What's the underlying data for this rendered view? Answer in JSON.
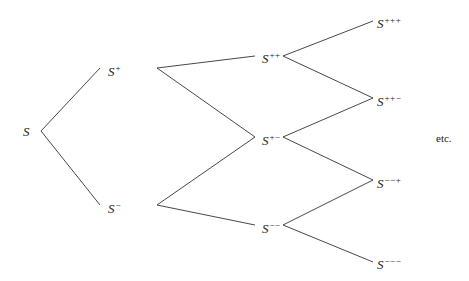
{
  "diagram": {
    "type": "binomial-tree",
    "line_color": "#333333",
    "nodes": [
      {
        "id": "S",
        "base": "S",
        "sup": "",
        "x": 23,
        "y": 125
      },
      {
        "id": "Sp",
        "base": "S",
        "sup": "+",
        "x": 108,
        "y": 62
      },
      {
        "id": "Sm",
        "base": "S",
        "sup": "−",
        "x": 108,
        "y": 199
      },
      {
        "id": "Spp",
        "base": "S",
        "sup": "++",
        "x": 262,
        "y": 49
      },
      {
        "id": "Spm",
        "base": "S",
        "sup": "+−",
        "x": 262,
        "y": 131
      },
      {
        "id": "Smm",
        "base": "S",
        "sup": "−−",
        "x": 262,
        "y": 219
      },
      {
        "id": "Sppp",
        "base": "S",
        "sup": "+++",
        "x": 377,
        "y": 14
      },
      {
        "id": "Sppm",
        "base": "S",
        "sup": "++−",
        "x": 377,
        "y": 92
      },
      {
        "id": "Smmp",
        "base": "S",
        "sup": "−−+",
        "x": 377,
        "y": 174
      },
      {
        "id": "Smmm",
        "base": "S",
        "sup": "−−−",
        "x": 377,
        "y": 255
      }
    ],
    "edges": [
      {
        "from": "S",
        "to": "Sp",
        "x1": 41,
        "y1": 131,
        "x2": 100,
        "y2": 68
      },
      {
        "from": "S",
        "to": "Sm",
        "x1": 41,
        "y1": 131,
        "x2": 100,
        "y2": 205
      },
      {
        "from": "Sp",
        "to": "Spp",
        "x1": 157,
        "y1": 68,
        "x2": 255,
        "y2": 56
      },
      {
        "from": "Sp",
        "to": "Spm",
        "x1": 157,
        "y1": 68,
        "x2": 255,
        "y2": 137
      },
      {
        "from": "Sm",
        "to": "Spm",
        "x1": 157,
        "y1": 205,
        "x2": 255,
        "y2": 137
      },
      {
        "from": "Sm",
        "to": "Smm",
        "x1": 157,
        "y1": 205,
        "x2": 255,
        "y2": 225
      },
      {
        "from": "Spp",
        "to": "Sppp",
        "x1": 283,
        "y1": 56,
        "x2": 373,
        "y2": 21
      },
      {
        "from": "Spp",
        "to": "Sppm",
        "x1": 283,
        "y1": 56,
        "x2": 373,
        "y2": 98
      },
      {
        "from": "Spm",
        "to": "Sppm",
        "x1": 283,
        "y1": 137,
        "x2": 373,
        "y2": 98
      },
      {
        "from": "Spm",
        "to": "Smmp",
        "x1": 283,
        "y1": 137,
        "x2": 373,
        "y2": 180
      },
      {
        "from": "Smm",
        "to": "Smmp",
        "x1": 283,
        "y1": 225,
        "x2": 373,
        "y2": 180
      },
      {
        "from": "Smm",
        "to": "Smmm",
        "x1": 283,
        "y1": 225,
        "x2": 373,
        "y2": 262
      }
    ],
    "continuation_label": "etc."
  }
}
